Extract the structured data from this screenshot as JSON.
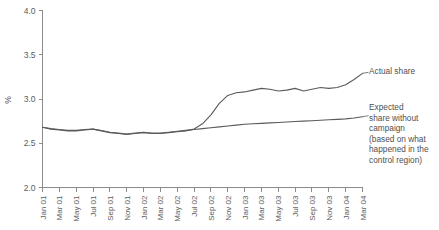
{
  "chart_data": {
    "type": "line",
    "title": "",
    "xlabel": "",
    "ylabel": "%",
    "ylim": [
      2.0,
      4.0
    ],
    "yticks": [
      "2.0",
      "2.5",
      "3.0",
      "3.5",
      "4.0"
    ],
    "ytick_values": [
      2.0,
      2.5,
      3.0,
      3.5,
      4.0
    ],
    "grid": false,
    "legend_position": "right-annotations",
    "x": [
      "Jan 01",
      "Feb 01",
      "Mar 01",
      "Apr 01",
      "May 01",
      "Jun 01",
      "Jul 01",
      "Aug 01",
      "Sep 01",
      "Oct 01",
      "Nov 01",
      "Dec 01",
      "Jan 02",
      "Feb 02",
      "Mar 02",
      "Apr 02",
      "May 02",
      "Jun 02",
      "Jul 02",
      "Aug 02",
      "Sep 02",
      "Oct 02",
      "Nov 02",
      "Dec 02",
      "Jan 03",
      "Feb 03",
      "Mar 03",
      "Apr 03",
      "May 03",
      "Jun 03",
      "Jul 03",
      "Aug 03",
      "Sep 03",
      "Oct 03",
      "Nov 03",
      "Dec 03",
      "Jan 04",
      "Feb 04",
      "Mar 04"
    ],
    "xtick_labels": [
      "Jan 01",
      "Mar 01",
      "May 01",
      "Jul 01",
      "Sep 01",
      "Nov 01",
      "Jan 02",
      "Mar 02",
      "May 02",
      "Jul 02",
      "Sep 02",
      "Nov 02",
      "Jan 03",
      "Mar 03",
      "May 03",
      "Jul 03",
      "Sep 03",
      "Nov 03",
      "Jan 04",
      "Mar 04"
    ],
    "series": [
      {
        "name": "Actual share",
        "color": "#5a5a5a",
        "values": [
          2.68,
          2.66,
          2.65,
          2.64,
          2.64,
          2.65,
          2.66,
          2.64,
          2.62,
          2.61,
          2.6,
          2.61,
          2.62,
          2.61,
          2.61,
          2.62,
          2.63,
          2.64,
          2.66,
          2.72,
          2.82,
          2.95,
          3.04,
          3.07,
          3.08,
          3.1,
          3.12,
          3.11,
          3.09,
          3.1,
          3.12,
          3.09,
          3.11,
          3.13,
          3.12,
          3.13,
          3.16,
          3.22,
          3.29
        ]
      },
      {
        "name": "Expected share without campaign",
        "color": "#5a5a5a",
        "values": [
          2.68,
          2.665,
          2.655,
          2.645,
          2.645,
          2.655,
          2.66,
          2.645,
          2.625,
          2.615,
          2.605,
          2.615,
          2.625,
          2.615,
          2.615,
          2.625,
          2.635,
          2.645,
          2.655,
          2.665,
          2.675,
          2.685,
          2.695,
          2.705,
          2.715,
          2.72,
          2.725,
          2.73,
          2.735,
          2.74,
          2.745,
          2.75,
          2.755,
          2.76,
          2.765,
          2.77,
          2.775,
          2.785,
          2.8
        ]
      }
    ],
    "annotations": [
      {
        "name": "Actual share",
        "text": "Actual share"
      },
      {
        "name": "Expected share without campaign",
        "text": "Expected\nshare without\ncampaign\n(based on what\nhappened in the\ncontrol region)"
      }
    ]
  },
  "axes": {
    "ylabel": "%",
    "ytick_labels": [
      "4.0",
      "3.5",
      "3.0",
      "2.5",
      "2.0"
    ],
    "xtick_labels": [
      "Jan 01",
      "Mar 01",
      "May 01",
      "Jul 01",
      "Sep 01",
      "Nov 01",
      "Jan 02",
      "Mar 02",
      "May 02",
      "Jul 02",
      "Sep 02",
      "Nov 02",
      "Jan 03",
      "Mar 03",
      "May 03",
      "Jul 03",
      "Sep 03",
      "Nov 03",
      "Jan 04",
      "Mar 04"
    ]
  },
  "annotations": {
    "actual": "Actual share",
    "expected_lines": [
      "Expected",
      "share without",
      "campaign",
      "(based on what",
      "happened in the",
      "control region)"
    ],
    "expected": "Expected\nshare without\ncampaign\n(based on what\nhappened in the\ncontrol region)"
  },
  "colors": {
    "line": "#5a5a5a",
    "axis": "#8b8b8b",
    "text": "#4f4f4f",
    "background": "#ffffff"
  }
}
